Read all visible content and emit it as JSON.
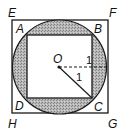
{
  "diagram": {
    "outer_square": {
      "name": "EFGH",
      "vertices": {
        "E": [
          12,
          20
        ],
        "F": [
          108,
          20
        ],
        "G": [
          108,
          113
        ],
        "H": [
          12,
          113
        ]
      }
    },
    "circle": {
      "center_label": "O",
      "center": [
        59,
        67
      ],
      "radius": 47
    },
    "inner_square": {
      "name": "ABCD",
      "vertices": {
        "A": [
          27,
          35
        ],
        "B": [
          92,
          35
        ],
        "C": [
          92,
          98
        ],
        "D": [
          27,
          98
        ]
      }
    },
    "segments": [
      {
        "from": "O",
        "to": "circle-right",
        "style": "dashed",
        "label": "1"
      },
      {
        "from": "O",
        "to": "C",
        "style": "solid",
        "label": "1"
      }
    ],
    "labels": {
      "E": "E",
      "F": "F",
      "G": "G",
      "H": "H",
      "A": "A",
      "B": "B",
      "C": "C",
      "D": "D",
      "O": "O",
      "radius_dashed": "1",
      "radius_solid": "1"
    },
    "colors": {
      "shade": "#b0b0b0",
      "line": "#1a1a1a",
      "background": "#ffffff"
    }
  }
}
